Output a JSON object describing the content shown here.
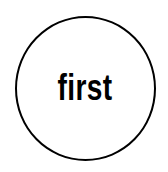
{
  "badge": {
    "text": "first",
    "stroke_color": "#000000",
    "background_color": "#ffffff"
  }
}
